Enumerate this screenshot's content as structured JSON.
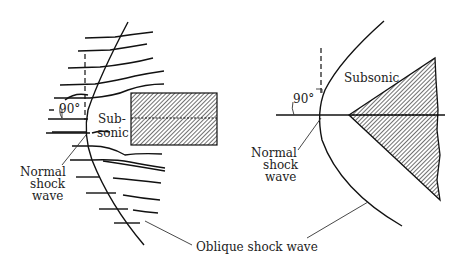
{
  "figure": {
    "left_panel": {
      "name": "blunt-body",
      "labels": {
        "angle": "90°",
        "subsonic_line1": "Sub-",
        "subsonic_line2": "sonic",
        "normal_line1": "Normal",
        "normal_line2": "shock",
        "normal_line3": "wave"
      }
    },
    "right_panel": {
      "name": "wedge-body",
      "labels": {
        "angle": "90°",
        "subsonic": "Subsonic",
        "normal_line1": "Normal",
        "normal_line2": "shock",
        "normal_line3": "wave"
      }
    },
    "shared_label": "Oblique shock wave"
  }
}
